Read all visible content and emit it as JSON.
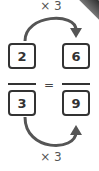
{
  "diagram": {
    "top_operation": "× 3",
    "bottom_operation": "× 3",
    "equals_sign": "=",
    "left_fraction": {
      "numerator": "2",
      "denominator": "3"
    },
    "right_fraction": {
      "numerator": "6",
      "denominator": "9"
    },
    "colors": {
      "stroke": "#333333",
      "arrow": "#555555",
      "label": "#555555",
      "background": "#ffffff"
    },
    "icons": [
      "curved-arrow-right-top",
      "curved-arrow-right-bottom",
      "page-curl"
    ]
  }
}
